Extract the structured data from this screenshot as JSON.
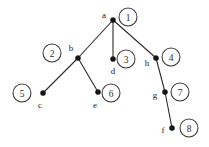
{
  "diagram": {
    "type": "tree-graph",
    "title": "",
    "width": 209,
    "height": 147,
    "background_color": "#ffffff",
    "edge_color": "#2b2b2b",
    "node_color": "#151515",
    "circle_color": "#3a3a3a",
    "nodes": [
      {
        "id": "a",
        "label": "a",
        "x": 113,
        "y": 20,
        "label_x": 104,
        "label_y": 16
      },
      {
        "id": "b",
        "label": "b",
        "x": 78,
        "y": 58,
        "label_x": 71,
        "label_y": 49
      },
      {
        "id": "d",
        "label": "d",
        "x": 113,
        "y": 59,
        "label_x": 113,
        "label_y": 72
      },
      {
        "id": "h",
        "label": "h",
        "x": 156,
        "y": 58,
        "label_x": 147,
        "label_y": 64
      },
      {
        "id": "c",
        "label": "c",
        "x": 43,
        "y": 93,
        "label_x": 40,
        "label_y": 106
      },
      {
        "id": "e",
        "label": "e",
        "x": 98,
        "y": 92,
        "label_x": 95,
        "label_y": 106
      },
      {
        "id": "g",
        "label": "g",
        "x": 165,
        "y": 92,
        "label_x": 155,
        "label_y": 96
      },
      {
        "id": "f",
        "label": "f",
        "x": 172,
        "y": 128,
        "label_x": 163,
        "label_y": 131
      }
    ],
    "edges": [
      {
        "from": "a",
        "to": "b",
        "x1": 113,
        "y1": 20,
        "x2": 78,
        "y2": 58
      },
      {
        "from": "a",
        "to": "d",
        "x1": 113,
        "y1": 20,
        "x2": 113,
        "y2": 59
      },
      {
        "from": "a",
        "to": "h",
        "x1": 113,
        "y1": 20,
        "x2": 156,
        "y2": 58
      },
      {
        "from": "b",
        "to": "c",
        "x1": 78,
        "y1": 58,
        "x2": 43,
        "y2": 93
      },
      {
        "from": "b",
        "to": "e",
        "x1": 78,
        "y1": 58,
        "x2": 98,
        "y2": 92
      },
      {
        "from": "h",
        "to": "g",
        "x1": 156,
        "y1": 58,
        "x2": 165,
        "y2": 92
      },
      {
        "from": "g",
        "to": "f",
        "x1": 165,
        "y1": 92,
        "x2": 172,
        "y2": 128
      }
    ],
    "order_markers": [
      {
        "number": "1",
        "node": "a",
        "cx": 128,
        "cy": 17,
        "r": 9
      },
      {
        "number": "2",
        "node": "b",
        "cx": 52,
        "cy": 53,
        "r": 9
      },
      {
        "number": "3",
        "node": "d",
        "cx": 126,
        "cy": 59,
        "r": 9
      },
      {
        "number": "4",
        "node": "h",
        "cx": 171,
        "cy": 57,
        "r": 9
      },
      {
        "number": "5",
        "node": "c",
        "cx": 22,
        "cy": 93,
        "r": 9
      },
      {
        "number": "6",
        "node": "e",
        "cx": 111,
        "cy": 93,
        "r": 9
      },
      {
        "number": "7",
        "node": "g",
        "cx": 180,
        "cy": 92,
        "r": 9
      },
      {
        "number": "8",
        "node": "f",
        "cx": 189,
        "cy": 128,
        "r": 9
      }
    ]
  }
}
